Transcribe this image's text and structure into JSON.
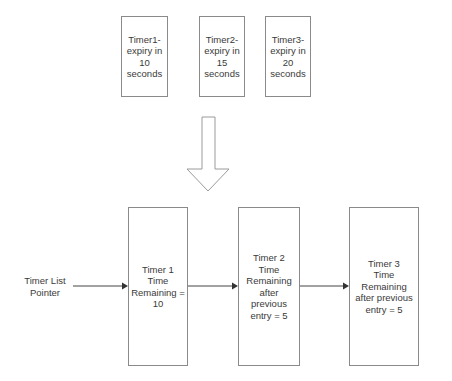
{
  "before": {
    "timers": [
      {
        "label": "Timer1-\nexpiry in\n10\nseconds"
      },
      {
        "label": "Timer2-\nexpiry in\n15\nseconds"
      },
      {
        "label": "Timer3-\nexpiry in\n20\nseconds"
      }
    ]
  },
  "transform_arrow": {
    "icon": "down-arrow-icon"
  },
  "after": {
    "pointer_label": "Timer List\nPointer",
    "nodes": [
      {
        "label": "Timer 1\nTime\nRemaining =\n10"
      },
      {
        "label": "Timer 2\nTime\nRemaining\nafter\nprevious\nentry = 5"
      },
      {
        "label": "Timer 3\nTime\nRemaining\nafter previous\nentry = 5"
      }
    ]
  },
  "colors": {
    "border": "#8a8a8a",
    "arrow": "#333333",
    "text": "#3a3a3a"
  }
}
